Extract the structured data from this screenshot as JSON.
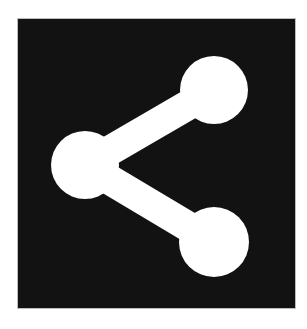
{
  "icon": {
    "name": "share",
    "tile_color": "#121212",
    "glyph_color": "#ffffff",
    "background_color": "#ffffff",
    "tile": {
      "x": 18,
      "y": 19,
      "width": 277,
      "height": 289
    },
    "nodes": [
      {
        "id": "top-right",
        "cx": 214,
        "cy": 90,
        "r": 34
      },
      {
        "id": "left",
        "cx": 85,
        "cy": 165,
        "r": 34
      },
      {
        "id": "bottom-right",
        "cx": 214,
        "cy": 242,
        "r": 35
      }
    ],
    "connector_width": 30
  }
}
